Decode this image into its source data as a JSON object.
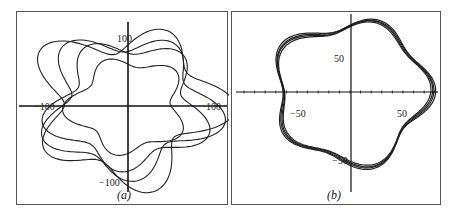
{
  "chart_data": [
    {
      "type": "line",
      "panel": "(a)",
      "title": "",
      "xlabel": "",
      "ylabel": "",
      "xlim": [
        -120,
        120
      ],
      "ylim": [
        -115,
        115
      ],
      "x_ticks": [
        -100,
        100
      ],
      "y_ticks": [
        100,
        -100
      ],
      "x_tick_labels": [
        "-100",
        "100"
      ],
      "y_tick_labels": [
        "100",
        "-100"
      ],
      "grid": false,
      "legend": null,
      "description": "Several distinct non-closing orbit loops with five-lobed wavy shape",
      "series": [
        {
          "name": "loop1",
          "r0": 98,
          "amp": 22,
          "k": 5,
          "phase": 0.3
        },
        {
          "name": "loop2",
          "r0": 90,
          "amp": 18,
          "k": 5,
          "phase": 1.1
        },
        {
          "name": "loop3",
          "r0": 82,
          "amp": 15,
          "k": 5,
          "phase": 2.0
        },
        {
          "name": "loop4",
          "r0": 62,
          "amp": 10,
          "k": 5,
          "phase": 2.7
        }
      ]
    },
    {
      "type": "line",
      "panel": "(b)",
      "title": "",
      "xlabel": "",
      "ylabel": "",
      "xlim": [
        -85,
        85
      ],
      "ylim": [
        -80,
        85
      ],
      "x_ticks": [
        -50,
        50
      ],
      "y_ticks": [
        50,
        -50
      ],
      "x_tick_labels": [
        "-50",
        "50"
      ],
      "y_tick_labels": [
        "50",
        "-50"
      ],
      "grid": false,
      "legend": null,
      "description": "Nearly overlapping closed loops (converged periodic orbit)",
      "series": [
        {
          "name": "loop1",
          "r0": 70,
          "amp": 7,
          "k": 5,
          "phase": 0.0
        },
        {
          "name": "loop2",
          "r0": 71,
          "amp": 7,
          "k": 5,
          "phase": 0.05
        },
        {
          "name": "loop3",
          "r0": 72,
          "amp": 7.5,
          "k": 5,
          "phase": 0.1
        },
        {
          "name": "loop4",
          "r0": 69,
          "amp": 6.5,
          "k": 5,
          "phase": -0.05
        }
      ]
    }
  ],
  "labels": {
    "panel_a": "(a)",
    "panel_b": "(b)",
    "a_y_top": "100",
    "a_y_bottom": "-100",
    "a_x_left": "-100",
    "a_x_right": "100",
    "b_y_top": "50",
    "b_y_bottom": "-50",
    "b_x_left": "-50",
    "b_x_right": "50"
  },
  "colors": {
    "curve": "#222222",
    "axis": "#111111",
    "frame": "#555555"
  }
}
